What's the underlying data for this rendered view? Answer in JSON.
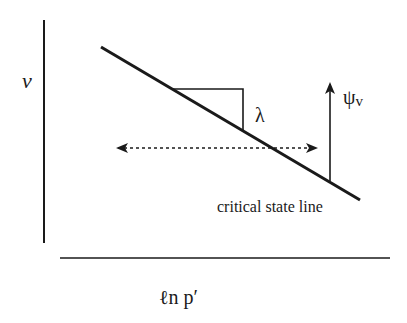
{
  "diagram": {
    "y_axis_label": "v",
    "x_axis_label": "ℓn p′",
    "line_label": "critical state line",
    "slope_label": "λ",
    "state_parameter_label": "ψ",
    "state_parameter_subscript": "v",
    "colors": {
      "ink": "#1a1a1a",
      "background": "#ffffff"
    }
  }
}
